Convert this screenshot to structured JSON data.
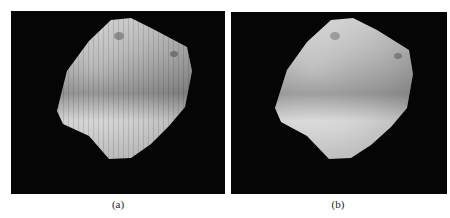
{
  "figure": {
    "panels": [
      {
        "id": "a",
        "caption": "(a)",
        "description": "rendered grayscale surface patch with vertical streak artifacts on black background"
      },
      {
        "id": "b",
        "caption": "(b)",
        "description": "smoothed rendered grayscale surface patch on black background"
      }
    ],
    "colors": {
      "background": "#050505",
      "surface_light": "#e8e8e8",
      "surface_dark": "#6a6a6a",
      "page": "#ffffff"
    }
  }
}
